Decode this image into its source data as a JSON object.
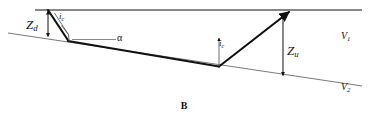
{
  "figure": {
    "caption": "B",
    "labels": {
      "depth_down": {
        "symbol": "Z",
        "sub": "d"
      },
      "critical_angle_left": {
        "symbol": "i",
        "sub": "c"
      },
      "dip_angle": {
        "symbol": "α",
        "sub": ""
      },
      "critical_angle_right": {
        "symbol": "i",
        "sub": "c"
      },
      "depth_up": {
        "symbol": "Z",
        "sub": "u"
      },
      "velocity_upper": {
        "symbol": "V",
        "sub": "1"
      },
      "velocity_lower": {
        "symbol": "V",
        "sub": "2"
      }
    }
  },
  "colors": {
    "ink": "#111111",
    "thin_line": "#6b6b6b",
    "background": "#ffffff"
  },
  "geometry": {
    "surface_line": {
      "x1": 35,
      "y1": 10,
      "x2": 362,
      "y2": 10
    },
    "interface_line": {
      "x1": 8,
      "y1": 33,
      "x2": 362,
      "y2": 86
    },
    "downgoing_ray": {
      "x1": 48,
      "y1": 10,
      "x2": 68,
      "y2": 41
    },
    "refracted_ray": {
      "x1": 68,
      "y1": 41,
      "x2": 219,
      "y2": 66
    },
    "upgoing_ray": {
      "x1": 219,
      "y1": 66,
      "x2": 290,
      "y2": 12
    },
    "zd_arrow": {
      "x": 48,
      "y1": 11,
      "y2": 37
    },
    "zu_arrow": {
      "x": 283,
      "y1": 13,
      "y2": 76
    },
    "alpha_reference": {
      "x1": 72,
      "y1": 39,
      "x2": 116,
      "y2": 39
    },
    "ic_left_normal": {
      "x1": 55,
      "y1": 14,
      "x2": 69,
      "y2": 36
    },
    "ic_right_normal": {
      "x1": 219,
      "y1": 38,
      "x2": 219,
      "y2": 66
    }
  }
}
